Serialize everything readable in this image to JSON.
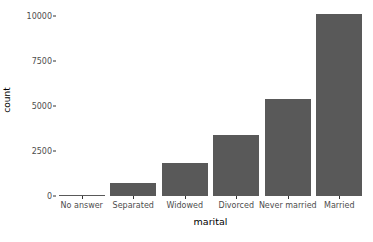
{
  "chart_data": {
    "type": "bar",
    "title": "",
    "subtitle": "",
    "xlabel": "marital",
    "ylabel": "count",
    "categories": [
      "No answer",
      "Separated",
      "Widowed",
      "Divorced",
      "Never married",
      "Married"
    ],
    "values": [
      17,
      743,
      1807,
      3383,
      5416,
      10117
    ],
    "ylim": [
      0,
      10000
    ],
    "xlim_categories": 6,
    "y_ticks": [
      0,
      2500,
      5000,
      7500,
      10000
    ],
    "y_tick_labels": [
      "0",
      "2500",
      "5000",
      "7500",
      "10000"
    ],
    "grid": false,
    "legend": "none",
    "bar_color": "#595959",
    "panel_background": "#ffffff",
    "axis_text_color": "#4d4d4d",
    "axis_title_color": "#000000"
  }
}
